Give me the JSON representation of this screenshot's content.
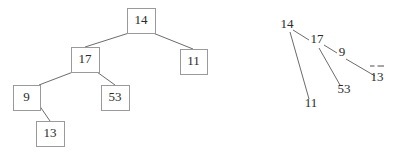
{
  "canvas": {
    "width": 401,
    "height": 161,
    "background": "#ffffff"
  },
  "style": {
    "node_fill": "#ffffff",
    "node_border": "#9a9a9a",
    "edge_color": "#6b6b6b",
    "text_color": "#2b2b2b"
  },
  "left_diagram": {
    "name": "boxed-binary-tree",
    "nodes": [
      {
        "id": "n14",
        "label": "14",
        "x": 127,
        "y": 8,
        "w": 28,
        "h": 25
      },
      {
        "id": "n17",
        "label": "17",
        "x": 71,
        "y": 47,
        "w": 28,
        "h": 25
      },
      {
        "id": "n11",
        "label": "11",
        "x": 180,
        "y": 49,
        "w": 27,
        "h": 25
      },
      {
        "id": "n9",
        "label": "9",
        "x": 13,
        "y": 85,
        "w": 27,
        "h": 25
      },
      {
        "id": "n53",
        "label": "53",
        "x": 101,
        "y": 85,
        "w": 28,
        "h": 25
      },
      {
        "id": "n13",
        "label": "13",
        "x": 36,
        "y": 121,
        "w": 28,
        "h": 25
      }
    ],
    "edges": [
      {
        "from": "n14",
        "to": "n17",
        "x1": 129,
        "y1": 33,
        "x2": 85,
        "y2": 47
      },
      {
        "from": "n14",
        "to": "n11",
        "x1": 153,
        "y1": 33,
        "x2": 193,
        "y2": 49
      },
      {
        "from": "n17",
        "to": "n9",
        "x1": 73,
        "y1": 72,
        "x2": 39,
        "y2": 85
      },
      {
        "from": "n17",
        "to": "n53",
        "x1": 97,
        "y1": 72,
        "x2": 115,
        "y2": 85
      },
      {
        "from": "n9",
        "to": "n13",
        "x1": 39,
        "y1": 105,
        "x2": 50,
        "y2": 121
      }
    ]
  },
  "right_diagram": {
    "name": "plain-text-tree",
    "nodes": [
      {
        "id": "r14",
        "label": "14",
        "cx": 287,
        "cy": 28
      },
      {
        "id": "r17",
        "label": "17",
        "cx": 317,
        "cy": 43
      },
      {
        "id": "r9",
        "label": "9",
        "cx": 342,
        "cy": 56
      },
      {
        "id": "r13",
        "label": "13",
        "cx": 377,
        "cy": 81
      },
      {
        "id": "r53",
        "label": "53",
        "cx": 344,
        "cy": 93
      },
      {
        "id": "r11",
        "label": "11",
        "cx": 311,
        "cy": 107
      }
    ],
    "edges": [
      {
        "from": "r14",
        "to": "r17",
        "x1": 293,
        "y1": 30,
        "x2": 309,
        "y2": 40
      },
      {
        "from": "r14",
        "to": "r11",
        "x1": 290,
        "y1": 32,
        "x2": 309,
        "y2": 99
      },
      {
        "from": "r17",
        "to": "r9",
        "x1": 324,
        "y1": 45,
        "x2": 337,
        "y2": 53
      },
      {
        "from": "r17",
        "to": "r53",
        "x1": 319,
        "y1": 48,
        "x2": 340,
        "y2": 85
      },
      {
        "from": "r9",
        "to": "r13",
        "x1": 346,
        "y1": 59,
        "x2": 375,
        "y2": 76
      }
    ],
    "null_marker": {
      "id": "r13-null-dashes",
      "label": "--",
      "x": 370,
      "y": 66,
      "width": 13
    }
  }
}
